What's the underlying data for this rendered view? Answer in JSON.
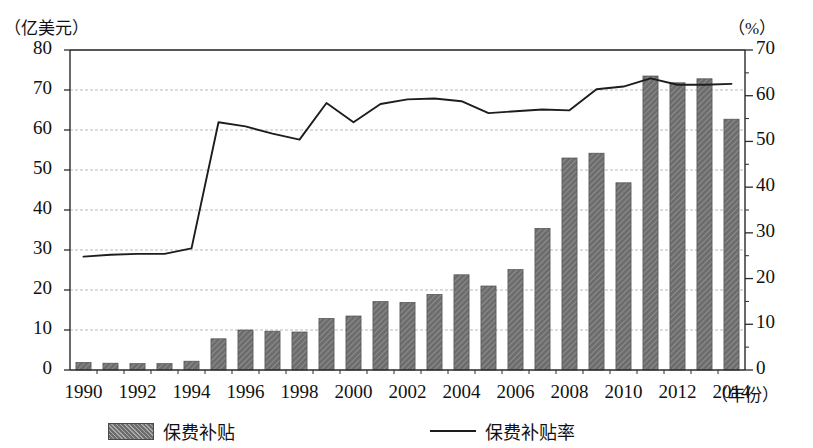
{
  "chart_data": {
    "type": "bar",
    "title": "",
    "subtitle": "",
    "xlabel": "（年份）",
    "ylabel": "（亿美元）",
    "y2label": "（%）",
    "ylim": [
      0,
      80
    ],
    "y2lim": [
      0,
      70
    ],
    "ytick_labels": [
      "80",
      "70",
      "60",
      "50",
      "40",
      "30",
      "20",
      "10",
      "0"
    ],
    "ytick_values": [
      80,
      70,
      60,
      50,
      40,
      30,
      20,
      10,
      0
    ],
    "y2tick_labels": [
      "70",
      "60",
      "50",
      "40",
      "30",
      "20",
      "10",
      "0"
    ],
    "y2tick_values": [
      70,
      60,
      50,
      40,
      30,
      20,
      10,
      0
    ],
    "grid": true,
    "legend_position": "bottom",
    "categories": [
      "1990",
      "1991",
      "1992",
      "1993",
      "1994",
      "1995",
      "1996",
      "1997",
      "1998",
      "1999",
      "2000",
      "2001",
      "2002",
      "2003",
      "2004",
      "2005",
      "2006",
      "2007",
      "2008",
      "2009",
      "2010",
      "2011",
      "2012",
      "2013",
      "2014"
    ],
    "xtick_labels": [
      "1990",
      "1992",
      "1994",
      "1996",
      "1998",
      "2000",
      "2002",
      "2004",
      "2006",
      "2008",
      "2010",
      "2012",
      "2014"
    ],
    "series": [
      {
        "name": "保费补贴",
        "type": "bar",
        "axis": "left",
        "unit": "亿美元",
        "color": "#6d6d6d",
        "values": [
          1.9,
          1.7,
          1.6,
          1.6,
          2.2,
          7.8,
          10.0,
          9.7,
          9.5,
          12.9,
          13.5,
          17.1,
          16.9,
          18.9,
          23.8,
          21.0,
          25.1,
          35.4,
          53.0,
          54.2,
          46.8,
          73.5,
          71.8,
          72.8,
          62.7
        ]
      },
      {
        "name": "保费补贴率",
        "type": "line",
        "axis": "right",
        "unit": "%",
        "color": "#1d1d1d",
        "values": [
          24.8,
          25.2,
          25.4,
          25.4,
          26.6,
          54.2,
          53.3,
          51.7,
          50.4,
          58.4,
          54.2,
          58.2,
          59.2,
          59.4,
          58.8,
          56.2,
          56.6,
          57.0,
          56.8,
          61.4,
          62.0,
          63.8,
          62.4,
          62.4,
          62.6
        ]
      }
    ]
  },
  "legend": {
    "bar_label": "保费补贴",
    "line_label": "保费补贴率"
  }
}
